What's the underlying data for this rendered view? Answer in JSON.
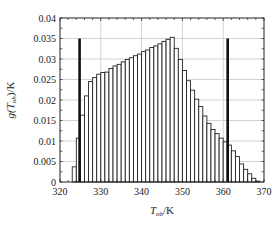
{
  "chart_data": {
    "type": "bar",
    "title": "",
    "xlabel": "T_ob/K",
    "xlabel_main": "T",
    "xlabel_sub": "ob",
    "xlabel_unit": "/K",
    "ylabel": "g(T_ob)/K",
    "ylabel_prefix": "g(T",
    "ylabel_sub": "ob",
    "ylabel_unit": ")/K",
    "xlim": [
      320,
      370
    ],
    "ylim": [
      0,
      0.04
    ],
    "grid": true,
    "xticks": [
      320,
      330,
      340,
      350,
      360,
      370
    ],
    "yticks": [
      0,
      0.005,
      0.01,
      0.015,
      0.02,
      0.025,
      0.03,
      0.035,
      0.04
    ],
    "xtick_labels": [
      "320",
      "330",
      "340",
      "350",
      "360",
      "370"
    ],
    "ytick_labels": [
      "0",
      "0.005",
      "0.01",
      "0.015",
      "0.02",
      "0.025",
      "0.03",
      "0.035",
      "0.04"
    ],
    "bin_width": 1,
    "bins": [
      323,
      324,
      325,
      326,
      327,
      328,
      329,
      330,
      331,
      332,
      333,
      334,
      335,
      336,
      337,
      338,
      339,
      340,
      341,
      342,
      343,
      344,
      345,
      346,
      347,
      348,
      349,
      350,
      351,
      352,
      353,
      354,
      355,
      356,
      357,
      358,
      359,
      360,
      361,
      362,
      363,
      364,
      365,
      366,
      367,
      368
    ],
    "values": [
      0.0037,
      0.0107,
      0.0163,
      0.021,
      0.0245,
      0.0255,
      0.0263,
      0.0267,
      0.0268,
      0.0277,
      0.0283,
      0.0287,
      0.0293,
      0.0299,
      0.0303,
      0.0308,
      0.0312,
      0.0318,
      0.0322,
      0.0328,
      0.0332,
      0.0337,
      0.0343,
      0.0348,
      0.0353,
      0.0326,
      0.0299,
      0.0272,
      0.0247,
      0.0224,
      0.0202,
      0.0184,
      0.0161,
      0.0143,
      0.0128,
      0.0118,
      0.0107,
      0.0098,
      0.009,
      0.0076,
      0.0062,
      0.0044,
      0.0031,
      0.002,
      0.0009,
      0.0002
    ],
    "markers": [
      {
        "x": 324.8,
        "height": 0.035,
        "style": "thick-line"
      },
      {
        "x": 361.1,
        "height": 0.035,
        "style": "thick-line"
      }
    ]
  },
  "colors": {
    "bar_fill": "#ffffff",
    "bar_stroke": "#222222",
    "marker": "#111111",
    "grid": "#c8c8c8",
    "axis": "#222222"
  }
}
